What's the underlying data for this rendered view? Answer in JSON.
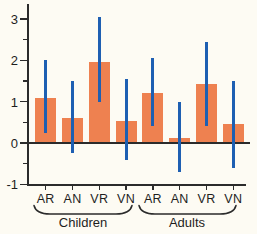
{
  "chart_data": {
    "type": "bar",
    "title": "",
    "xlabel": "",
    "ylabel": "",
    "ylim": [
      -1,
      3.35
    ],
    "grid": false,
    "legend": null,
    "y_ticks": [
      {
        "value": 3,
        "label": "3"
      },
      {
        "value": 2,
        "label": "2"
      },
      {
        "value": 1,
        "label": "1"
      },
      {
        "value": 0,
        "label": "0"
      },
      {
        "value": -1,
        "label": "-1"
      }
    ],
    "y_minor_ticks": [
      2.5,
      1.5,
      0.5,
      -0.5
    ],
    "bars": [
      {
        "group": "Children",
        "category": "AR",
        "value": 1.1,
        "err_low": 0.25,
        "err_high": 2.0
      },
      {
        "group": "Children",
        "category": "AN",
        "value": 0.6,
        "err_low": -0.25,
        "err_high": 1.5
      },
      {
        "group": "Children",
        "category": "VR",
        "value": 1.95,
        "err_low": 1.0,
        "err_high": 3.05
      },
      {
        "group": "Children",
        "category": "VN",
        "value": 0.53,
        "err_low": -0.4,
        "err_high": 1.55
      },
      {
        "group": "Adults",
        "category": "AR",
        "value": 1.2,
        "err_low": 0.4,
        "err_high": 2.05
      },
      {
        "group": "Adults",
        "category": "AN",
        "value": 0.13,
        "err_low": -0.7,
        "err_high": 1.0
      },
      {
        "group": "Adults",
        "category": "VR",
        "value": 1.42,
        "err_low": 0.4,
        "err_high": 2.45
      },
      {
        "group": "Adults",
        "category": "VN",
        "value": 0.45,
        "err_low": -0.6,
        "err_high": 1.5
      }
    ],
    "groups": [
      {
        "label": "Children"
      },
      {
        "label": "Adults"
      }
    ],
    "colors": {
      "bar": "#EE8150",
      "error_bar": "#1E5FB2",
      "axis": "#2b2b2b",
      "text": "#1e1e1e",
      "background": "#FDFBF3"
    }
  }
}
